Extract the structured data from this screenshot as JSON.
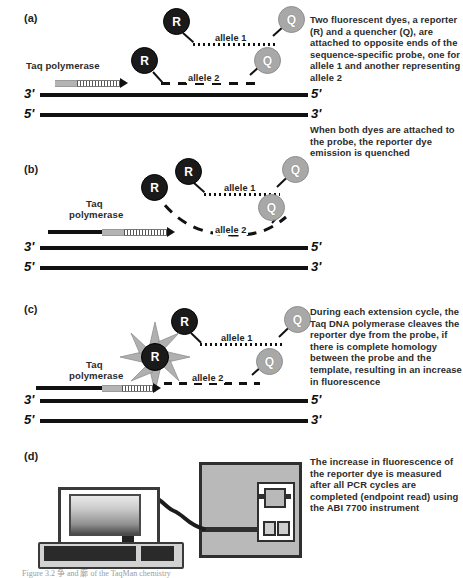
{
  "figure": {
    "caption": "Figure 3.2    争 and 廓 of the TaqMan chemistry"
  },
  "panels": [
    {
      "id": "a",
      "label": "(a)",
      "taq_label": "Taq polymerase",
      "allele1_label": "allele 1",
      "allele2_label": "allele 2",
      "reporter_label": "R",
      "quencher_label": "Q",
      "strand_top_left": "3'",
      "strand_top_right": "5'",
      "strand_bottom_left": "5'",
      "strand_bottom_right": "3'"
    },
    {
      "id": "b",
      "label": "(b)",
      "taq_label_line1": "Taq",
      "taq_label_line2": "polymerase",
      "allele1_label": "allele 1",
      "allele2_label": "allele 2",
      "reporter_label": "R",
      "quencher_label": "Q",
      "strand_top_left": "3'",
      "strand_top_right": "5'",
      "strand_bottom_left": "5'",
      "strand_bottom_right": "3'"
    },
    {
      "id": "c",
      "label": "(c)",
      "taq_label_line1": "Taq",
      "taq_label_line2": "polymerase",
      "allele1_label": "allele 1",
      "allele2_label": "allele 2",
      "reporter_label": "R",
      "quencher_label": "Q",
      "strand_top_left": "3'",
      "strand_top_right": "5'",
      "strand_bottom_left": "5'",
      "strand_bottom_right": "3'"
    },
    {
      "id": "d",
      "label": "(d)"
    }
  ],
  "notes": {
    "note_a": "Two fluorescent dyes, a reporter (R) and a quencher (Q), are attached to opposite ends of the sequence-specific probe, one for allele 1 and another representing allele 2",
    "note_a2": "When both dyes are attached to the probe, the reporter dye emission is quenched",
    "note_c": "During each extension cycle, the Taq DNA polymerase cleaves the reporter dye from the probe, if there is complete homology between the probe and the template, resulting in an increase in fluorescence",
    "note_d": "The increase in fluorescence of the reporter dye is measured after all PCR cycles are completed (endpoint read) using the ABI 7700 instrument"
  },
  "colors": {
    "reporter_fill": "#1a1a1a",
    "quencher_fill": "#a8a8a8",
    "strand": "#111111",
    "polymerase_block": "#b4b4b4",
    "instrument_body": "#b9b9b9",
    "text": "#2b2b2b"
  }
}
